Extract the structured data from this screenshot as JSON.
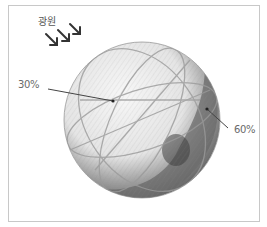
{
  "figure": {
    "light_source_label": "광원",
    "labels": [
      {
        "text": "30%",
        "points_to": "lit-side"
      },
      {
        "text": "60%",
        "points_to": "shadow-side"
      }
    ],
    "colors": {
      "frame": "#c8c8c8",
      "label_text": "#6a6a6a",
      "arrow": "#333333",
      "sphere_light": "#e9e9e9",
      "sphere_shadow": "#6f6f6f"
    }
  }
}
